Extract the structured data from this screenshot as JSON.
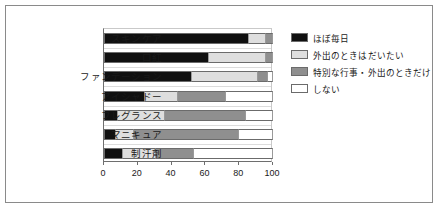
{
  "chart_data": {
    "type": "bar",
    "orientation": "horizontal",
    "stacked": true,
    "title": "",
    "subtitle": "",
    "xlabel": "",
    "ylabel": "",
    "xlim": [
      0,
      100
    ],
    "xticks": [
      0,
      20,
      40,
      60,
      80,
      100
    ],
    "xticklabels": [
      "0",
      "20",
      "40",
      "60",
      "80",
      "100"
    ],
    "grid": false,
    "legend_position": "right",
    "categories": [
      "スキンケア",
      "口紅",
      "ファンデーション",
      "アイシャドー",
      "フレグランス",
      "マニキュア",
      "制汗剤"
    ],
    "series": [
      {
        "name": "ほぼ毎日",
        "color": "#101010",
        "values": [
          86,
          62,
          52,
          24,
          8,
          7,
          11
        ]
      },
      {
        "name": "外出のときはだいたい",
        "color": "#dedede",
        "values": [
          10,
          34,
          39,
          20,
          28,
          11,
          20
        ]
      },
      {
        "name": "特別な行事・外出のときだけ",
        "color": "#8f8f8f",
        "values": [
          4,
          4,
          6,
          28,
          48,
          62,
          22
        ]
      },
      {
        "name": "しない",
        "color": "#ffffff",
        "values": [
          0,
          0,
          3,
          28,
          16,
          20,
          47
        ]
      }
    ]
  },
  "colors": {
    "frame": "#8a8a8a",
    "axis": "#6e6e6e",
    "background": "#ffffff"
  }
}
